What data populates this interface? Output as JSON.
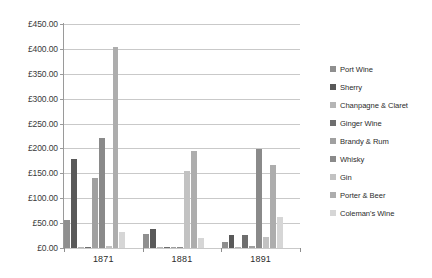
{
  "chart_data": {
    "type": "bar",
    "title": "",
    "xlabel": "",
    "ylabel": "",
    "categories": [
      "1871",
      "1881",
      "1891"
    ],
    "ylim": [
      0,
      450
    ],
    "ytick_step": 50,
    "ytick_labels": [
      "£450.00",
      "£400.00",
      "£350.00",
      "£300.00",
      "£250.00",
      "£200.00",
      "£150.00",
      "£100.00",
      "£50.00",
      "£0.00"
    ],
    "ytick_values": [
      450,
      400,
      350,
      300,
      250,
      200,
      150,
      100,
      50,
      0
    ],
    "currency": "£",
    "grid": true,
    "legend_position": "right",
    "series": [
      {
        "name": "Port Wine",
        "color": "#8f8f8f",
        "values": [
          57,
          28,
          12
        ]
      },
      {
        "name": "Sherry",
        "color": "#595959",
        "values": [
          178,
          38,
          26
        ]
      },
      {
        "name": "Chanpagne & Claret",
        "color": "#b5b5b5",
        "values": [
          3,
          2,
          2
        ]
      },
      {
        "name": "Ginger Wine",
        "color": "#6e6e6e",
        "values": [
          2,
          2,
          26
        ]
      },
      {
        "name": "Brandy & Rum",
        "color": "#a0a0a0",
        "values": [
          140,
          3,
          4
        ]
      },
      {
        "name": "Whisky",
        "color": "#8a8a8a",
        "values": [
          222,
          3,
          198
        ]
      },
      {
        "name": "Gin",
        "color": "#c2c2c2",
        "values": [
          4,
          155,
          22
        ]
      },
      {
        "name": "Porter & Beer",
        "color": "#adadad",
        "values": [
          403,
          195,
          167
        ]
      },
      {
        "name": "Coleman's Wine",
        "color": "#d6d6d6",
        "values": [
          33,
          20,
          62
        ]
      }
    ]
  },
  "legend": {
    "items": [
      {
        "label": "Port Wine"
      },
      {
        "label": "Sherry"
      },
      {
        "label": "Chanpagne & Claret"
      },
      {
        "label": "Ginger Wine"
      },
      {
        "label": "Brandy & Rum"
      },
      {
        "label": "Whisky"
      },
      {
        "label": "Gin"
      },
      {
        "label": "Porter & Beer"
      },
      {
        "label": "Coleman's Wine"
      }
    ]
  }
}
